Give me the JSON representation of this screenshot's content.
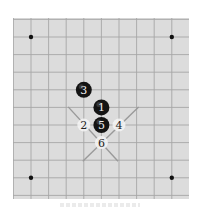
{
  "diagram": {
    "type": "go-board-fragment",
    "colors": {
      "board": "#dcdcdc",
      "grid_line": "#a6a6a6",
      "star_point": "#111111",
      "black_stone": "#141414",
      "white_stone": "#f4f4f4",
      "black_label": "#f0f0f0",
      "white_label": "#222222",
      "marker_line": "#9a9a9a"
    },
    "grid": {
      "columns": 9,
      "rows": 9,
      "spacing_px": 17.6,
      "origin_x": 18,
      "origin_y": 19
    },
    "star_points": [
      {
        "col": 0,
        "row": 0
      },
      {
        "col": 8,
        "row": 0
      },
      {
        "col": 0,
        "row": 8
      },
      {
        "col": 8,
        "row": 8
      }
    ],
    "stones": [
      {
        "number": "1",
        "color": "black",
        "col": 4,
        "row": 4
      },
      {
        "number": "2",
        "color": "white",
        "col": 3,
        "row": 5
      },
      {
        "number": "3",
        "color": "black",
        "col": 3,
        "row": 3
      },
      {
        "number": "4",
        "color": "white",
        "col": 5,
        "row": 5
      },
      {
        "number": "5",
        "color": "black",
        "col": 4,
        "row": 5
      },
      {
        "number": "6",
        "color": "white",
        "col": 4,
        "row": 6
      }
    ],
    "marker_lines": [
      {
        "from": [
          2,
          4
        ],
        "to": [
          5,
          7
        ]
      },
      {
        "from": [
          6,
          4
        ],
        "to": [
          3,
          7
        ]
      }
    ]
  }
}
